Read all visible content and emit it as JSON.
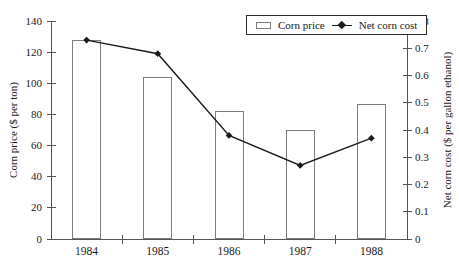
{
  "chart_data": {
    "type": "bar+line",
    "categories": [
      "1984",
      "1985",
      "1986",
      "1987",
      "1988"
    ],
    "series": [
      {
        "name": "Corn price",
        "type": "bar",
        "axis": "left",
        "values": [
          128,
          104,
          82,
          70,
          87
        ]
      },
      {
        "name": "Net corn cost",
        "type": "line",
        "axis": "right",
        "values": [
          0.73,
          0.68,
          0.38,
          0.27,
          0.37
        ]
      }
    ],
    "left_axis": {
      "label": "Corn price ($ per ton)",
      "min": 0,
      "max": 140,
      "step": 20,
      "ticks": [
        "0",
        "20",
        "40",
        "60",
        "80",
        "100",
        "120",
        "140"
      ]
    },
    "right_axis": {
      "label": "Net corn cost ($ per gallon ethanol)",
      "min": 0,
      "max": 0.8,
      "step": 0.1,
      "ticks": [
        "0",
        "0.1",
        "0.2",
        "0.3",
        "0.4",
        "0.5",
        "0.6",
        "0.7",
        "0.8"
      ]
    },
    "legend": {
      "position": "top-right",
      "entries": [
        "Corn price",
        "Net corn cost"
      ]
    },
    "grid": "off",
    "colors": {
      "background": "#ffffff",
      "bar_fill": "#ffffff",
      "bar_border": "#7d7d7d",
      "line": "#1b1b1b",
      "axis": "#555555",
      "text": "#1a1a1a"
    }
  }
}
